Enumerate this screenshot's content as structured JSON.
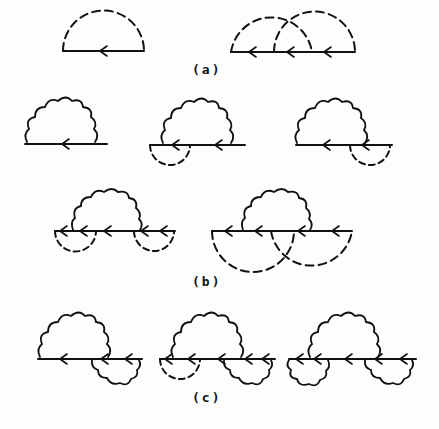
{
  "figure": {
    "panels": [
      {
        "id": "a",
        "label": "(a)",
        "description": "Dashed-line self-energy diagrams on a fermion line"
      },
      {
        "id": "b",
        "label": "(b)",
        "description": "Wavy-line (photon) self-energy with dashed insertions"
      },
      {
        "id": "c",
        "label": "(c)",
        "description": "Wavy-line self-energy with wavy and dashed insertions"
      }
    ],
    "colors": {
      "ink": "#111111",
      "background": "#fdfdfd"
    }
  }
}
